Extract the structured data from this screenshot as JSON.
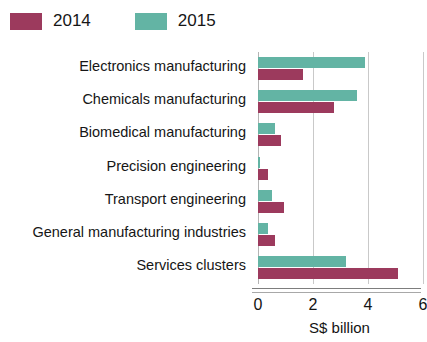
{
  "legend": {
    "items": [
      {
        "label": "2014",
        "color": "#9c3a5d"
      },
      {
        "label": "2015",
        "color": "#63b4a4"
      }
    ]
  },
  "axis": {
    "title": "S$ billion",
    "ticks": [
      "0",
      "2",
      "4",
      "6"
    ]
  },
  "chart_data": {
    "type": "bar",
    "orientation": "horizontal",
    "title": "",
    "xlabel": "S$ billion",
    "ylabel": "",
    "xlim": [
      0,
      6
    ],
    "xticks": [
      0,
      2,
      4,
      6
    ],
    "grid": true,
    "legend_position": "top-left",
    "categories": [
      "Electronics manufacturing",
      "Chemicals manufacturing",
      "Biomedical manufacturing",
      "Precision engineering",
      "Transport engineering",
      "General manufacturing industries",
      "Services clusters"
    ],
    "series": [
      {
        "name": "2014",
        "color": "#9c3a5d",
        "values": [
          1.65,
          2.75,
          0.85,
          0.35,
          0.95,
          0.6,
          5.1
        ]
      },
      {
        "name": "2015",
        "color": "#63b4a4",
        "values": [
          3.9,
          3.6,
          0.6,
          0.05,
          0.5,
          0.35,
          3.2
        ]
      }
    ]
  }
}
